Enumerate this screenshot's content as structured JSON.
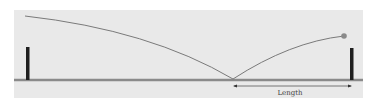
{
  "diagram": {
    "title": "",
    "labels": {
      "dimension": "Length"
    },
    "colors": {
      "panel_background": "#e9e9e9",
      "ground": "#8a8a8a",
      "post": "#1e1e1e",
      "curve": "#7a7a7a",
      "ball": "#8a8a8a",
      "dimension_line": "#555555"
    },
    "elements": [
      "left-post",
      "right-post",
      "ground-line",
      "trajectory-curve",
      "ball",
      "length-dimension-arrow"
    ]
  }
}
